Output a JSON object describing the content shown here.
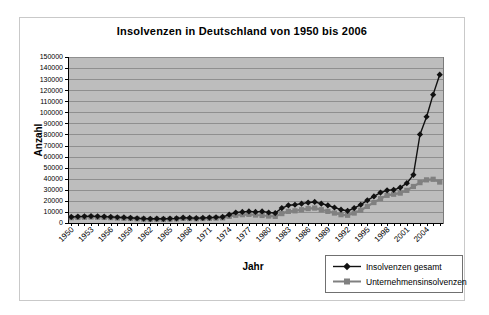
{
  "window": {
    "background": "#ffffff",
    "frame_border_color": "#c9c9c9"
  },
  "chart_data": {
    "type": "line",
    "title": "Insolvenzen in Deutschland von 1950 bis 2006",
    "xlabel": "Jahr",
    "ylabel": "Anzahl",
    "ylim": [
      0,
      150000
    ],
    "y_tick_step": 10000,
    "x_tick_step": 3,
    "grid": true,
    "plot_background": "#bdbdbd",
    "gridline_color": "#8f8f8f",
    "axis_color": "#000000",
    "legend_position": "bottom-right",
    "x": [
      1950,
      1951,
      1952,
      1953,
      1954,
      1955,
      1956,
      1957,
      1958,
      1959,
      1960,
      1961,
      1962,
      1963,
      1964,
      1965,
      1966,
      1967,
      1968,
      1969,
      1970,
      1971,
      1972,
      1973,
      1974,
      1975,
      1976,
      1977,
      1978,
      1979,
      1980,
      1981,
      1982,
      1983,
      1984,
      1985,
      1986,
      1987,
      1988,
      1989,
      1990,
      1991,
      1992,
      1993,
      1994,
      1995,
      1996,
      1997,
      1998,
      1999,
      2000,
      2001,
      2002,
      2003,
      2004,
      2005,
      2006
    ],
    "x_tick_labels": [
      "1950",
      "1953",
      "1956",
      "1959",
      "1962",
      "1965",
      "1968",
      "1971",
      "1974",
      "1977",
      "1980",
      "1983",
      "1986",
      "1989",
      "1992",
      "1995",
      "1998",
      "2001",
      "2004"
    ],
    "series": [
      {
        "name": "Insolvenzen gesamt",
        "marker": "diamond",
        "color": "#111111",
        "values": [
          5500,
          5800,
          6000,
          6200,
          6000,
          5800,
          5500,
          5200,
          5000,
          4700,
          4300,
          4000,
          3800,
          3900,
          3800,
          4000,
          4200,
          4800,
          4600,
          4400,
          4600,
          4900,
          5200,
          5500,
          7500,
          9500,
          10000,
          10500,
          10000,
          10500,
          9500,
          9000,
          13500,
          16000,
          16500,
          17500,
          18500,
          19000,
          17500,
          16000,
          14000,
          12000,
          11000,
          13500,
          16500,
          20500,
          24000,
          27500,
          29500,
          30000,
          32000,
          36000,
          43500,
          80000,
          96000,
          116000,
          134000
        ]
      },
      {
        "name": "Unternehmensinsolvenzen",
        "marker": "square",
        "color": "#808080",
        "values": [
          4800,
          5000,
          5200,
          5400,
          5200,
          5000,
          4800,
          4500,
          4300,
          4100,
          3800,
          3500,
          3300,
          3400,
          3300,
          3500,
          3700,
          4200,
          4000,
          3800,
          4000,
          4200,
          4400,
          4600,
          6000,
          7000,
          7500,
          7800,
          7200,
          6800,
          6300,
          6000,
          8500,
          10500,
          11000,
          12000,
          13000,
          13500,
          12000,
          10500,
          9000,
          7500,
          7000,
          9000,
          11500,
          15000,
          18500,
          22000,
          25000,
          26000,
          27000,
          29500,
          33000,
          36500,
          39000,
          39500,
          37000
        ]
      }
    ]
  }
}
